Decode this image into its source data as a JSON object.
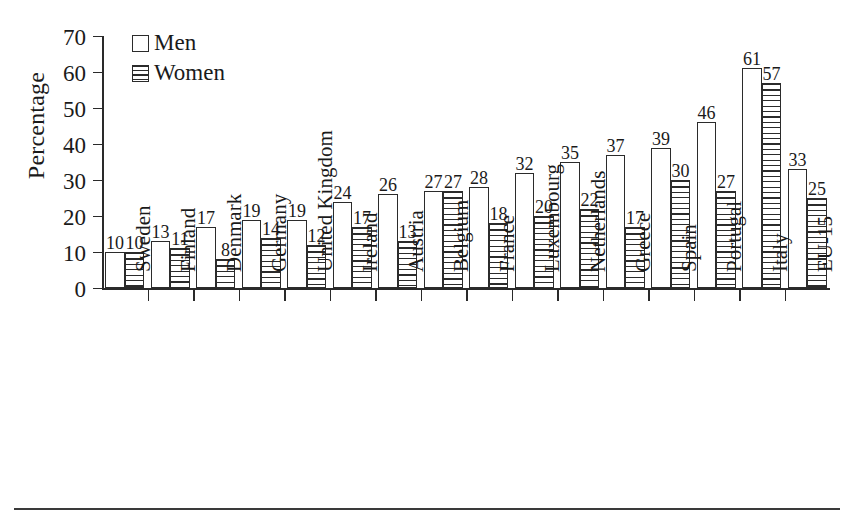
{
  "chart_data": {
    "type": "bar",
    "title": "",
    "subtitle": "",
    "xlabel": "",
    "ylabel": "Percentage",
    "ylim": [
      0,
      70
    ],
    "ytick_step": 10,
    "yticks": [
      70,
      60,
      50,
      40,
      30,
      20,
      10,
      0
    ],
    "grid": false,
    "legend_position": "top-left",
    "categories": [
      "Sweden",
      "Finland",
      "Denmark",
      "Germany",
      "United Kingdom",
      "Ireland",
      "Austria",
      "Belgium",
      "France",
      "Luxembourg",
      "Netherlands",
      "Greece",
      "Spain",
      "Portugal",
      "Italy",
      "EU-15"
    ],
    "series": [
      {
        "name": "Men",
        "fill": "white",
        "values": [
          10,
          13,
          17,
          19,
          19,
          24,
          26,
          27,
          28,
          32,
          35,
          37,
          39,
          46,
          61,
          33
        ]
      },
      {
        "name": "Women",
        "fill": "horizontal-hatch",
        "values": [
          10,
          11,
          8,
          14,
          12,
          17,
          13,
          27,
          18,
          20,
          22,
          17,
          30,
          27,
          57,
          25
        ]
      }
    ],
    "data_labels_shown": true
  },
  "legend": {
    "items": [
      {
        "label": "Men",
        "swatch": "empty-square-icon"
      },
      {
        "label": "Women",
        "swatch": "hatched-square-icon"
      }
    ]
  },
  "colors": {
    "ink": "#2b2b2b",
    "text": "#1a1a1a",
    "background": "#ffffff"
  }
}
